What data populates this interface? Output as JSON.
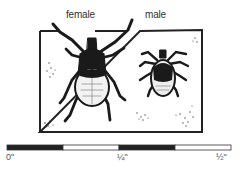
{
  "figure": {
    "labels": {
      "female": "female",
      "male": "male"
    },
    "subjects": [
      {
        "name": "female tick",
        "relative_size": "larger"
      },
      {
        "name": "male tick",
        "relative_size": "smaller"
      }
    ],
    "scale_bar": {
      "unit": "inch",
      "ticks": [
        {
          "label": "0\"",
          "value": 0
        },
        {
          "label": "¼\"",
          "value": 0.25
        },
        {
          "label": "½\"",
          "value": 0.5
        }
      ],
      "segments": [
        {
          "from": 0,
          "to": 0.125,
          "fill": "#222222"
        },
        {
          "from": 0.125,
          "to": 0.25,
          "fill": "#ffffff"
        },
        {
          "from": 0.25,
          "to": 0.375,
          "fill": "#222222"
        },
        {
          "from": 0.375,
          "to": 0.5,
          "fill": "#ffffff"
        }
      ]
    }
  }
}
